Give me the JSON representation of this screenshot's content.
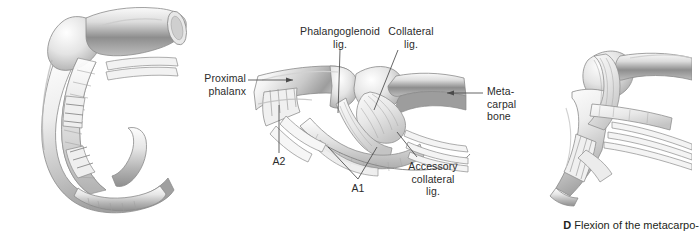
{
  "figure": {
    "background_color": "#ffffff",
    "text_color": "#2b2b2b",
    "leader_color": "#4a4a4a",
    "panels": [
      {
        "id": "panel-left",
        "name": "flexed-finger-sagittal-view",
        "description": "Sagittal anatomical drawing of a flexed finger with flexor tendon sheath"
      },
      {
        "id": "panel-middle",
        "name": "mcp-joint-ligaments-view",
        "description": "Lateral view of metacarpophalangeal joint showing collateral and phalangoglenoid ligaments"
      },
      {
        "id": "panel-right",
        "name": "mcp-joint-flexion-view",
        "description": "Lateral view of metacarpophalangeal joint in flexion"
      }
    ]
  },
  "labels": {
    "proximal_phalanx": "Proximal\nphalanx",
    "phalangoglenoid_lig": "Phalangoglenoid\nlig.",
    "collateral_lig": "Collateral\nlig.",
    "metacarpal_bone": "Meta-\ncarpal\nbone",
    "accessory_collateral_lig": "Accessory\ncollateral\nlig.",
    "a1": "A1",
    "a2": "A2"
  },
  "caption": {
    "marker": "D",
    "text": "Flexion of the metacarpo-"
  }
}
